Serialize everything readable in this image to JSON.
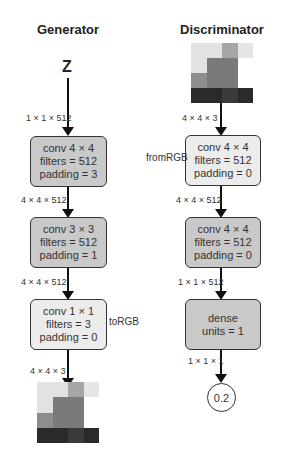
{
  "generator": {
    "title": "Generator",
    "input_label": "Z",
    "edges": [
      "1 × 1 × 512",
      "4 × 4 × 512",
      "4 × 4 × 512",
      "4 × 4 × 3"
    ],
    "blocks": [
      {
        "line1": "conv 4 × 4",
        "line2": "filters = 512",
        "line3": "padding = 3"
      },
      {
        "line1": "conv 3 × 3",
        "line2": "filters = 512",
        "line3": "padding = 1"
      },
      {
        "line1": "conv 1 × 1",
        "line2": "filters = 3",
        "line3": "padding = 0",
        "side_label": "toRGB"
      }
    ],
    "output_image_colors": [
      "#e2e2e2",
      "#e2e2e2",
      "#a6a6a6",
      "#e6e6e6",
      "#e2e2e2",
      "#7a7a7a",
      "#7a7a7a",
      "#ffffff",
      "#8d8d8d",
      "#7a7a7a",
      "#7a7a7a",
      "#ffffff",
      "#2a2a2a",
      "#2a2a2a",
      "#3a3a3a",
      "#2a2a2a"
    ]
  },
  "discriminator": {
    "title": "Discriminator",
    "edges": [
      "4 × 4 × 3",
      "4 × 4 × 512",
      "1 × 1 × 512",
      "1 × 1 × 1"
    ],
    "blocks": [
      {
        "line1": "conv 4 × 4",
        "line2": "filters = 512",
        "line3": "padding = 0",
        "side_label": "fromRGB"
      },
      {
        "line1": "conv 4 × 4",
        "line2": "filters = 512",
        "line3": "padding = 0"
      },
      {
        "line1": "dense",
        "line2": "units = 1"
      }
    ],
    "output_value": "0.2",
    "input_image_colors": [
      "#e2e2e2",
      "#e2e2e2",
      "#a6a6a6",
      "#e6e6e6",
      "#e2e2e2",
      "#7a7a7a",
      "#7a7a7a",
      "#ffffff",
      "#8d8d8d",
      "#7a7a7a",
      "#7a7a7a",
      "#ffffff",
      "#2a2a2a",
      "#2a2a2a",
      "#3a3a3a",
      "#2a2a2a"
    ]
  }
}
